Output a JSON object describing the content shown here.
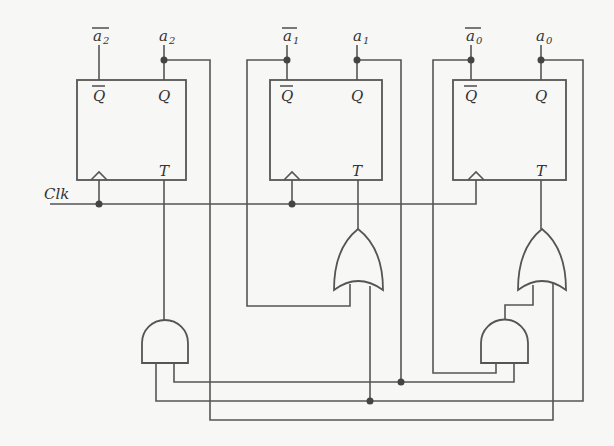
{
  "diagram": {
    "type": "synchronous counter circuit (T flip-flops)",
    "clock_label": "Clk",
    "flip_flops": [
      {
        "id": "ff2",
        "qbar_label": "Q",
        "q_label": "Q",
        "t_label": "T",
        "out_qbar": "a",
        "out_qbar_sub": "2",
        "out_q": "a",
        "out_q_sub": "2"
      },
      {
        "id": "ff1",
        "qbar_label": "Q",
        "q_label": "Q",
        "t_label": "T",
        "out_qbar": "a",
        "out_qbar_sub": "1",
        "out_q": "a",
        "out_q_sub": "1"
      },
      {
        "id": "ff0",
        "qbar_label": "Q",
        "q_label": "Q",
        "t_label": "T",
        "out_qbar": "a",
        "out_qbar_sub": "0",
        "out_q": "a",
        "out_q_sub": "0"
      }
    ],
    "gates": [
      {
        "id": "and-a2",
        "type": "AND"
      },
      {
        "id": "or-a1",
        "type": "OR"
      },
      {
        "id": "or-a0",
        "type": "OR"
      },
      {
        "id": "and-a0",
        "type": "AND"
      }
    ]
  }
}
